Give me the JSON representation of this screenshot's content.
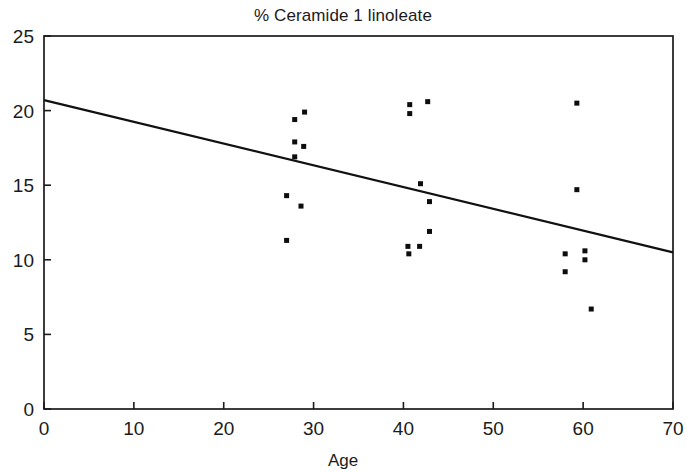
{
  "chart_data": {
    "type": "scatter",
    "title": "% Ceramide 1 linoleate",
    "xlabel": "Age",
    "ylabel": "",
    "xlim": [
      0,
      70
    ],
    "ylim": [
      0,
      25
    ],
    "xticks": [
      0,
      10,
      20,
      30,
      40,
      50,
      60,
      70
    ],
    "yticks": [
      0,
      5,
      10,
      15,
      20,
      25
    ],
    "grid": false,
    "legend": null,
    "point_color": "#0d0d0d",
    "line_color": "#111111",
    "series": [
      {
        "name": "Subjects",
        "marker": "square",
        "points": [
          {
            "x": 27.0,
            "y": 11.3
          },
          {
            "x": 27.0,
            "y": 14.3
          },
          {
            "x": 27.9,
            "y": 17.9
          },
          {
            "x": 27.9,
            "y": 16.9
          },
          {
            "x": 27.9,
            "y": 19.4
          },
          {
            "x": 29.0,
            "y": 19.9
          },
          {
            "x": 28.9,
            "y": 17.6
          },
          {
            "x": 28.6,
            "y": 13.6
          },
          {
            "x": 40.7,
            "y": 20.4
          },
          {
            "x": 40.7,
            "y": 19.8
          },
          {
            "x": 42.7,
            "y": 20.6
          },
          {
            "x": 41.9,
            "y": 15.1
          },
          {
            "x": 42.9,
            "y": 13.9
          },
          {
            "x": 42.9,
            "y": 11.9
          },
          {
            "x": 40.5,
            "y": 10.9
          },
          {
            "x": 41.8,
            "y": 10.9
          },
          {
            "x": 40.6,
            "y": 10.4
          },
          {
            "x": 59.3,
            "y": 20.5
          },
          {
            "x": 59.3,
            "y": 14.7
          },
          {
            "x": 58.0,
            "y": 10.4
          },
          {
            "x": 60.2,
            "y": 10.6
          },
          {
            "x": 60.2,
            "y": 10.0
          },
          {
            "x": 58.0,
            "y": 9.2
          },
          {
            "x": 60.9,
            "y": 6.7
          }
        ]
      }
    ],
    "fit_line": {
      "name": "Linear regression",
      "x0": 0,
      "y0": 20.7,
      "x1": 70,
      "y1": 10.5
    }
  },
  "axes": {
    "x_tick_labels": [
      "0",
      "10",
      "20",
      "30",
      "40",
      "50",
      "60",
      "70"
    ],
    "y_tick_labels": [
      "0",
      "5",
      "10",
      "15",
      "20",
      "25"
    ],
    "x_axis_title": "Age"
  },
  "figure": {
    "title": "% Ceramide 1 linoleate",
    "background": "#ffffff"
  }
}
